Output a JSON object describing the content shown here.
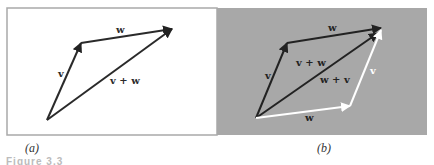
{
  "figure": {
    "panels": [
      {
        "id": "a",
        "label": "(a)",
        "background": "#ffffff",
        "border": "#a9a9a9",
        "vectors": [
          {
            "name": "v",
            "label": "v",
            "from": [
              47,
              120
            ],
            "to": [
              81,
              43
            ],
            "color": "#2a2a2a"
          },
          {
            "name": "w",
            "label": "w",
            "from": [
              81,
              43
            ],
            "to": [
              172,
              29
            ],
            "color": "#2a2a2a"
          },
          {
            "name": "v+w",
            "label": "v + w",
            "from": [
              47,
              120
            ],
            "to": [
              172,
              29
            ],
            "color": "#2a2a2a"
          }
        ],
        "labels": [
          {
            "text": "v",
            "x": 58,
            "y": 77
          },
          {
            "text": "w",
            "x": 116,
            "y": 33
          },
          {
            "text": "v + w",
            "x": 110,
            "y": 84
          }
        ]
      },
      {
        "id": "b",
        "label": "(b)",
        "background": "#a8a8a8",
        "vectors": [
          {
            "name": "v",
            "label": "v",
            "from": [
              256,
              118
            ],
            "to": [
              287,
              43
            ],
            "color": "#222222"
          },
          {
            "name": "w-top",
            "label": "w",
            "from": [
              287,
              43
            ],
            "to": [
              381,
              28
            ],
            "color": "#222222"
          },
          {
            "name": "v+w",
            "label": "v + w",
            "from": [
              256,
              118
            ],
            "to": [
              378,
              33
            ],
            "color": "#222222"
          },
          {
            "name": "w-bottom",
            "label": "w",
            "from": [
              256,
              118
            ],
            "to": [
              350,
              106
            ],
            "color": "#ffffff"
          },
          {
            "name": "v-right",
            "label": "v",
            "from": [
              350,
              106
            ],
            "to": [
              381,
              30
            ],
            "color": "#ffffff"
          }
        ],
        "labels": [
          {
            "text": "v",
            "x": 265,
            "y": 79,
            "color": "#222222"
          },
          {
            "text": "w",
            "x": 328,
            "y": 31,
            "color": "#222222"
          },
          {
            "text": "v + w",
            "x": 296,
            "y": 66,
            "color": "#222222"
          },
          {
            "text": "w + v",
            "x": 320,
            "y": 83,
            "color": "#222222"
          },
          {
            "text": "v",
            "x": 370,
            "y": 74,
            "color": "#ffffff"
          },
          {
            "text": "w",
            "x": 305,
            "y": 121,
            "color": "#222222"
          }
        ]
      }
    ],
    "caption": "Figure 3.3"
  }
}
